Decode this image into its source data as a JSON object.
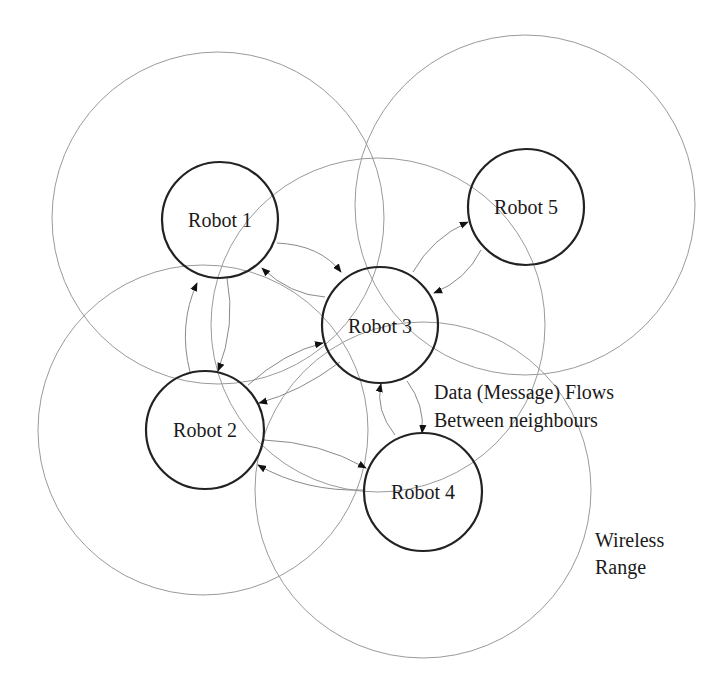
{
  "diagram": {
    "type": "network-topology",
    "robots": [
      {
        "id": "r1",
        "label": "Robot 1",
        "cx": 220,
        "cy": 220,
        "r": 58,
        "range_cx": 218,
        "range_cy": 218,
        "range_r": 166
      },
      {
        "id": "r2",
        "label": "Robot 2",
        "cx": 205,
        "cy": 430,
        "r": 59,
        "range_cx": 203,
        "range_cy": 430,
        "range_r": 165
      },
      {
        "id": "r3",
        "label": "Robot 3",
        "cx": 380,
        "cy": 325,
        "r": 58,
        "range_cx": 378,
        "range_cy": 325,
        "range_r": 167
      },
      {
        "id": "r4",
        "label": "Robot 4",
        "cx": 423,
        "cy": 492,
        "r": 59,
        "range_cx": 423,
        "range_cy": 490,
        "range_r": 168
      },
      {
        "id": "r5",
        "label": "Robot 5",
        "cx": 526,
        "cy": 207,
        "r": 58,
        "range_cx": 525,
        "range_cy": 205,
        "range_r": 170
      }
    ],
    "flows": [
      {
        "from": "Robot 1",
        "to": "Robot 3"
      },
      {
        "from": "Robot 3",
        "to": "Robot 1"
      },
      {
        "from": "Robot 1",
        "to": "Robot 2"
      },
      {
        "from": "Robot 2",
        "to": "Robot 1"
      },
      {
        "from": "Robot 2",
        "to": "Robot 3"
      },
      {
        "from": "Robot 3",
        "to": "Robot 2"
      },
      {
        "from": "Robot 3",
        "to": "Robot 5"
      },
      {
        "from": "Robot 5",
        "to": "Robot 3"
      },
      {
        "from": "Robot 3",
        "to": "Robot 4"
      },
      {
        "from": "Robot 4",
        "to": "Robot 3"
      },
      {
        "from": "Robot 2",
        "to": "Robot 4"
      },
      {
        "from": "Robot 4",
        "to": "Robot 2"
      }
    ],
    "annotations": {
      "flows_line1": "Data (Message) Flows",
      "flows_line2": "Between neighbours",
      "range_line1": "Wireless",
      "range_line2": "Range"
    },
    "colors": {
      "node_stroke": "#222222",
      "range_stroke": "#9a9a9a",
      "flow_stroke": "#8a8a8a",
      "text": "#1a1a1a"
    }
  }
}
